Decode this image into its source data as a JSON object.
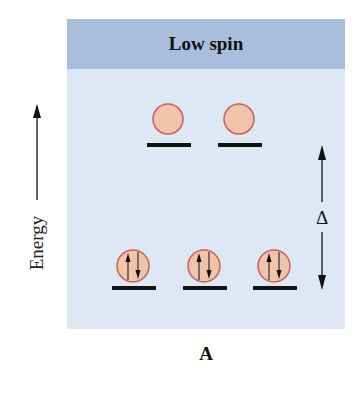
{
  "diagram": {
    "title": "Low spin",
    "caption": "A",
    "axis_label": "Energy",
    "gap_label": "Δ",
    "colors": {
      "panel_bg": "#dde8f4",
      "header_bg": "#a9bedd",
      "orbital_fill": "#f0c4a8",
      "orbital_stroke": "#c8605a",
      "level_bar": "#111111"
    },
    "upper_levels": {
      "name": "eg",
      "orbitals": [
        {
          "electrons": "empty"
        },
        {
          "electrons": "empty"
        }
      ]
    },
    "lower_levels": {
      "name": "t2g",
      "orbitals": [
        {
          "electrons": "paired (↑↓)"
        },
        {
          "electrons": "paired (↑↓)"
        },
        {
          "electrons": "paired (↑↓)"
        }
      ]
    }
  }
}
